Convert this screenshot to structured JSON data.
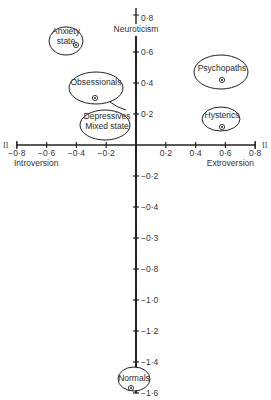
{
  "diagram": {
    "type": "scatter",
    "x_axis": {
      "title": "Extroversion",
      "negative_title": "Introversion",
      "end_marker": "II",
      "range": [
        -0.8,
        0.8
      ],
      "ticks": [
        {
          "value": -0.8,
          "label": "−0·8"
        },
        {
          "value": -0.6,
          "label": "−0·6"
        },
        {
          "value": -0.4,
          "label": "−0·4"
        },
        {
          "value": -0.2,
          "label": "−0·2"
        },
        {
          "value": 0.2,
          "label": "0·2"
        },
        {
          "value": 0.4,
          "label": "0·4"
        },
        {
          "value": 0.6,
          "label": "0·6"
        },
        {
          "value": 0.8,
          "label": "0·8"
        }
      ]
    },
    "y_axis": {
      "title": "Neuroticism",
      "end_marker": "I",
      "range": [
        -1.6,
        0.8
      ],
      "ticks": [
        {
          "value": 0.8,
          "label": "0·8"
        },
        {
          "value": 0.6,
          "label": "0·6"
        },
        {
          "value": 0.4,
          "label": "0·4"
        },
        {
          "value": 0.2,
          "label": "0·2"
        },
        {
          "value": -0.2,
          "label": "−0·2"
        },
        {
          "value": -0.4,
          "label": "−0·4"
        },
        {
          "value": -0.6,
          "label": "−0·3"
        },
        {
          "value": -0.8,
          "label": "−0·8"
        },
        {
          "value": -1.0,
          "label": "−1·0"
        },
        {
          "value": -1.2,
          "label": "−1·2"
        },
        {
          "value": -1.4,
          "label": "−1·4"
        },
        {
          "value": -1.6,
          "label": "−1·6"
        }
      ]
    },
    "groups": [
      {
        "name": "Anxiety state",
        "lines": [
          "Anxiety",
          "state"
        ],
        "x": -0.4,
        "y": 0.48
      },
      {
        "name": "Obsessionals",
        "lines": [
          "Obsessionals"
        ],
        "x": -0.28,
        "y": 0.26
      },
      {
        "name": "Depressives Mixed state",
        "lines": [
          "Depressives",
          "Mixed state"
        ],
        "x": -0.2,
        "y": 0.1
      },
      {
        "name": "Psychopaths",
        "lines": [
          "Psychopaths"
        ],
        "x": 0.6,
        "y": 0.42
      },
      {
        "name": "Hysterics",
        "lines": [
          "Hysterics"
        ],
        "x": 0.6,
        "y": 0.12
      },
      {
        "name": "Normals",
        "lines": [
          "Normals"
        ],
        "x": -0.02,
        "y": -1.58
      }
    ]
  },
  "chart_data": {
    "type": "scatter",
    "title": "",
    "xlabel": "Introversion – Extroversion",
    "ylabel": "Neuroticism",
    "xlim": [
      -0.8,
      0.8
    ],
    "ylim": [
      -1.6,
      0.8
    ],
    "grid": false,
    "points": [
      {
        "label": "Anxiety state",
        "x": -0.4,
        "y": 0.48
      },
      {
        "label": "Obsessionals",
        "x": -0.28,
        "y": 0.26
      },
      {
        "label": "Depressives / Mixed state",
        "x": -0.2,
        "y": 0.1
      },
      {
        "label": "Psychopaths",
        "x": 0.6,
        "y": 0.42
      },
      {
        "label": "Hysterics",
        "x": 0.6,
        "y": 0.12
      },
      {
        "label": "Normals",
        "x": -0.02,
        "y": -1.58
      }
    ]
  }
}
